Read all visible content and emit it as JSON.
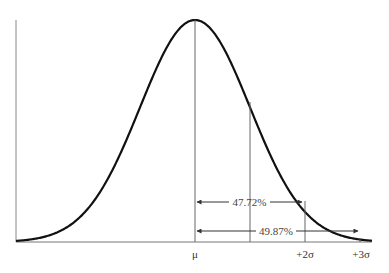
{
  "chart_data": {
    "type": "line",
    "title": "",
    "subtitle": "Normal distribution curve",
    "xlabel": "",
    "ylabel": "",
    "x_tick_labels": [
      "μ",
      "+2σ",
      "+3σ"
    ],
    "x_ticks_sigma": [
      0,
      2,
      3
    ],
    "reference_lines_sigma": [
      0,
      1,
      2
    ],
    "xlim_sigma": [
      -3,
      3
    ],
    "grid": false,
    "legend": null,
    "annotations": [
      {
        "text": "47.72%",
        "from_sigma": 0,
        "to_sigma": 2,
        "description": "Area between mean and +2σ"
      },
      {
        "text": "49.87%",
        "from_sigma": 0,
        "to_sigma": 3,
        "description": "Area between mean and +3σ"
      }
    ],
    "series": [
      {
        "name": "normal-curve",
        "function": "standard normal pdf",
        "x_sigma": [
          -3,
          -2.5,
          -2,
          -1.5,
          -1,
          -0.5,
          0,
          0.5,
          1,
          1.5,
          2,
          2.5,
          3
        ],
        "y_relative": [
          0.011,
          0.044,
          0.135,
          0.325,
          0.607,
          0.882,
          1.0,
          0.882,
          0.607,
          0.325,
          0.135,
          0.044,
          0.011
        ]
      }
    ]
  },
  "labels": {
    "mu": "μ",
    "plus2sigma": "+2σ",
    "plus3sigma": "+3σ",
    "pct_2sigma": "47.72%",
    "pct_3sigma": "49.87%"
  }
}
